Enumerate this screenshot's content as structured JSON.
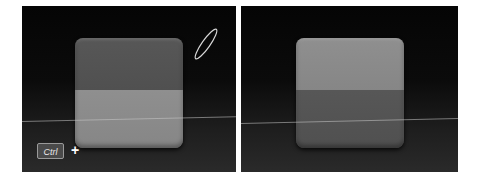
{
  "panels": [
    {
      "id": "before",
      "box": {
        "top_half": "dark",
        "bottom_half": "light"
      },
      "modifier_key": {
        "label": "Ctrl",
        "combinator": "+"
      },
      "cursor": "lasso-brush"
    },
    {
      "id": "after",
      "box": {
        "top_half": "light",
        "bottom_half": "dark"
      }
    }
  ],
  "colors": {
    "background": "#0a0a0a",
    "dark_face": "#545454",
    "light_face": "#8a8a8a",
    "scanline": "#c8c8c8"
  }
}
